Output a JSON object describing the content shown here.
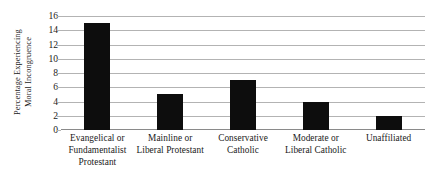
{
  "chart_data": {
    "type": "bar",
    "title": "",
    "xlabel": "",
    "ylabel": "Percentage Experiencing Moral Incongruence",
    "ylabel_lines": [
      "Percentage Experiencing",
      "Moral Incongruence"
    ],
    "categories": [
      "Evangelical or Fundamentalist Protestant",
      "Mainline or Liberal Protestant",
      "Conservative Catholic",
      "Moderate or Liberal Catholic",
      "Unaffiliated"
    ],
    "category_lines": [
      [
        "Evangelical or",
        "Fundamentalist",
        "Protestant"
      ],
      [
        "Mainline or",
        "Liberal Protestant"
      ],
      [
        "Conservative",
        "Catholic"
      ],
      [
        "Moderate or",
        "Liberal Catholic"
      ],
      [
        "Unaffiliated"
      ]
    ],
    "values": [
      15,
      5,
      7,
      4,
      2
    ],
    "ylim": [
      0,
      16
    ],
    "yticks": [
      0,
      2,
      4,
      6,
      8,
      10,
      12,
      14,
      16
    ],
    "ytick_labels": [
      "0",
      "2",
      "4",
      "6",
      "8",
      "10",
      "12",
      "14",
      "16"
    ],
    "grid": true,
    "grid_axis": "y",
    "legend": false,
    "legend_position": "none",
    "bar_color": "#0d0d0d",
    "gridline_color": "#b3b3b3",
    "axis_color": "#8a8a8a",
    "background_color": "#ffffff"
  }
}
